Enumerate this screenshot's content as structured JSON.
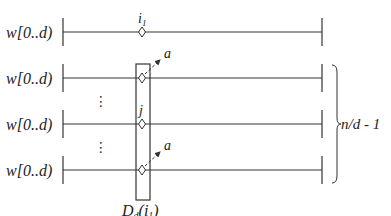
{
  "diagram": {
    "rows": [
      {
        "label": "w[0..d)",
        "y": 32,
        "marker_label": "i",
        "marker_sub": "1",
        "marker_x": 142,
        "arrow": false
      },
      {
        "label": "w[0..d)",
        "y": 78,
        "marker_label": "",
        "marker_x": 142,
        "arrow": true,
        "arrow_label": "a"
      },
      {
        "label": "w[0..d)",
        "y": 124,
        "marker_label": "j",
        "marker_x": 142,
        "arrow": false
      },
      {
        "label": "w[0..d)",
        "y": 170,
        "marker_label": "",
        "marker_x": 142,
        "arrow": true,
        "arrow_label": "a"
      }
    ],
    "ellipsis": "⋮",
    "box_label": {
      "main": "D",
      "sub": "d",
      "arg": "(i",
      "arg_sub": "1",
      "close": ")"
    },
    "brace_label": "n/d - 1",
    "colors": {
      "stroke": "#333333",
      "text": "#222222"
    }
  }
}
